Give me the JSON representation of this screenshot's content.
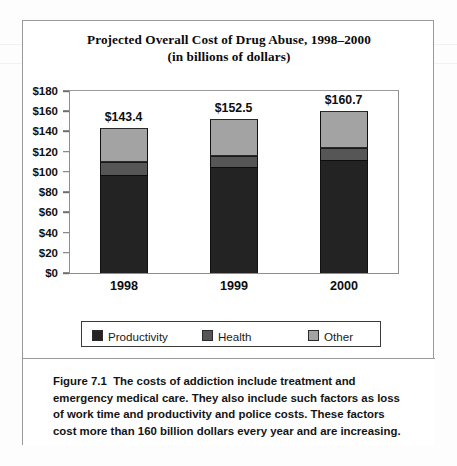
{
  "figure": {
    "title_line1": "Projected Overall Cost of Drug Abuse, 1998–2000",
    "title_line2": "(in billions of dollars)",
    "caption_label": "Figure 7.1",
    "caption_text": "The costs of addiction include treatment and emergency medical care. They also include such factors as loss of work time and productivity and police costs. These factors cost more than 160 billion dollars every year and are increasing."
  },
  "colors": {
    "productivity": "#232323",
    "health": "#565656",
    "other": "#a3a3a3",
    "frame": "#9a9a9a",
    "axis": "#8d8d8d"
  },
  "chart_data": {
    "type": "bar",
    "stacked": true,
    "title": "Projected Overall Cost of Drug Abuse, 1998–2000 (in billions of dollars)",
    "xlabel": "",
    "ylabel": "",
    "categories": [
      "1998",
      "1999",
      "2000"
    ],
    "ylim": [
      0,
      180
    ],
    "ytick_step": 20,
    "ytick_labels": [
      "$180",
      "$160",
      "$140",
      "$120",
      "$100",
      "$80",
      "$60",
      "$40",
      "$20",
      "$0"
    ],
    "ytick_values": [
      180,
      160,
      140,
      120,
      100,
      80,
      60,
      40,
      20,
      0
    ],
    "grid": false,
    "legend_position": "bottom",
    "series": [
      {
        "name": "Productivity",
        "color": "#232323",
        "values": [
          97.0,
          105.0,
          112.0
        ]
      },
      {
        "name": "Health",
        "color": "#565656",
        "values": [
          13.0,
          11.0,
          12.0
        ]
      },
      {
        "name": "Other",
        "color": "#a3a3a3",
        "values": [
          33.4,
          36.5,
          36.7
        ]
      }
    ],
    "totals": [
      143.4,
      152.5,
      160.7
    ],
    "data_labels": [
      "$143.4",
      "$152.5",
      "$160.7"
    ]
  },
  "legend": {
    "items": [
      {
        "label": "Productivity",
        "color": "#232323"
      },
      {
        "label": "Health",
        "color": "#565656"
      },
      {
        "label": "Other",
        "color": "#a3a3a3"
      }
    ]
  }
}
